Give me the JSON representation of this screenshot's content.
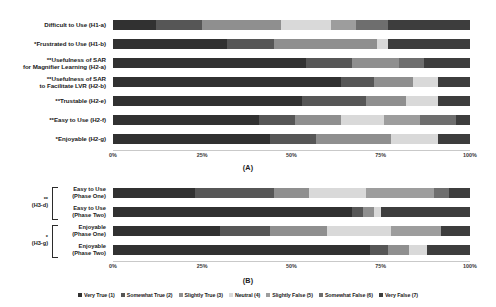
{
  "figure": {
    "panel_a_title": "(A)",
    "panel_b_title": "(B)",
    "axis_ticks": [
      "0%",
      "25%",
      "50%",
      "75%",
      "100%"
    ]
  },
  "legend": {
    "items": [
      {
        "label": "Very True (1)",
        "color": "#313131"
      },
      {
        "label": "Somewhat True (2)",
        "color": "#565656"
      },
      {
        "label": "Slightly True (3)",
        "color": "#8f8f8f"
      },
      {
        "label": "Neutral (4)",
        "color": "#d9d9d9"
      },
      {
        "label": "Slightly False (5)",
        "color": "#9d9d9d"
      },
      {
        "label": "Somewhat False (6)",
        "color": "#6e6e6e"
      },
      {
        "label": "Very False (7)",
        "color": "#3d3d3d"
      }
    ]
  },
  "chart_data": {
    "type": "bar",
    "title": "",
    "xlabel": "",
    "ylabel": "",
    "stacked": true,
    "orientation": "horizontal",
    "normalized_percent": true,
    "xlim": [
      0,
      100
    ],
    "grid": false,
    "legend_position": "bottom",
    "legend_entries": [
      "Very True (1)",
      "Somewhat True (2)",
      "Slightly True (3)",
      "Neutral (4)",
      "Slightly False (5)",
      "Somewhat False (6)",
      "Very False (7)"
    ],
    "panels": [
      {
        "name": "(A)",
        "categories": [
          {
            "significance": "",
            "label": "Difficult to Use (H1-a)",
            "values": [
              12,
              13,
              22,
              14,
              7,
              9,
              23
            ]
          },
          {
            "significance": "*",
            "label": "Frustrated to Use (H1-b)",
            "values": [
              32,
              13,
              29,
              3,
              0,
              0,
              23
            ]
          },
          {
            "significance": "**",
            "label": "Usefulness of SAR\nfor Magnifier Learning (H2-a)",
            "values": [
              54,
              13,
              13,
              0,
              0,
              7,
              13
            ]
          },
          {
            "significance": "**",
            "label": "Usefulness of SAR\nto Facilitate LVR (H2-b)",
            "values": [
              64,
              9,
              11,
              7,
              0,
              0,
              9
            ]
          },
          {
            "significance": "**",
            "label": "Trustable (H2-e)",
            "values": [
              53,
              18,
              11,
              9,
              0,
              0,
              9
            ]
          },
          {
            "significance": "**",
            "label": "Easy to Use (H2-f)",
            "values": [
              41,
              10,
              13,
              12,
              10,
              10,
              4
            ]
          },
          {
            "significance": "*",
            "label": "Enjoyable (H2-g)",
            "values": [
              44,
              13,
              21,
              13,
              0,
              0,
              9
            ]
          }
        ]
      },
      {
        "name": "(B)",
        "groups": [
          {
            "significance": "**",
            "bracket_label": "(H3-d)"
          },
          {
            "significance": "*",
            "bracket_label": "(H3-g)"
          }
        ],
        "categories": [
          {
            "group": 0,
            "label": "Easy to Use\n(Phase One)",
            "values": [
              23,
              22,
              10,
              16,
              19,
              4,
              6
            ]
          },
          {
            "group": 0,
            "label": "Easy to Use\n(Phase Two)",
            "values": [
              67,
              3,
              3,
              2,
              0,
              0,
              25
            ]
          },
          {
            "group": 1,
            "label": "Enjoyable\n(Phase One)",
            "values": [
              30,
              14,
              16,
              18,
              14,
              0,
              8
            ]
          },
          {
            "group": 1,
            "label": "Enjoyable\n(Phase Two)",
            "values": [
              72,
              5,
              6,
              5,
              0,
              0,
              12
            ]
          }
        ]
      }
    ]
  }
}
